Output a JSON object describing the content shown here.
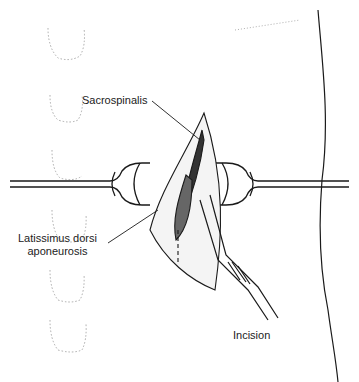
{
  "diagram": {
    "type": "surgical-illustration",
    "labels": {
      "sacrospinalis": "Sacrospinalis",
      "latissimus_line1": "Latissimus dorsi",
      "latissimus_line2": "aponeurosis",
      "incision": "Incision"
    },
    "colors": {
      "ink": "#1a1a1a",
      "faint": "#9a9a9a",
      "background": "#ffffff"
    }
  }
}
